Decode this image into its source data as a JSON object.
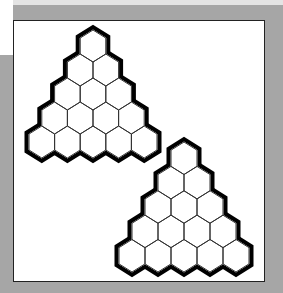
{
  "figure": {
    "background_color": "#a6a6a6",
    "frame_color": "#ffffff",
    "line_color": "#000000"
  },
  "puzzles": [
    {
      "name": "hex-triangle-top",
      "rows": 5,
      "apex": [
        93,
        30
      ],
      "hex_width": 25.6,
      "hex_height": 32
    },
    {
      "name": "hex-triangle-bottom",
      "rows": 5,
      "apex": [
        184,
        142
      ],
      "hex_width": 26,
      "hex_height": 32.5
    }
  ]
}
